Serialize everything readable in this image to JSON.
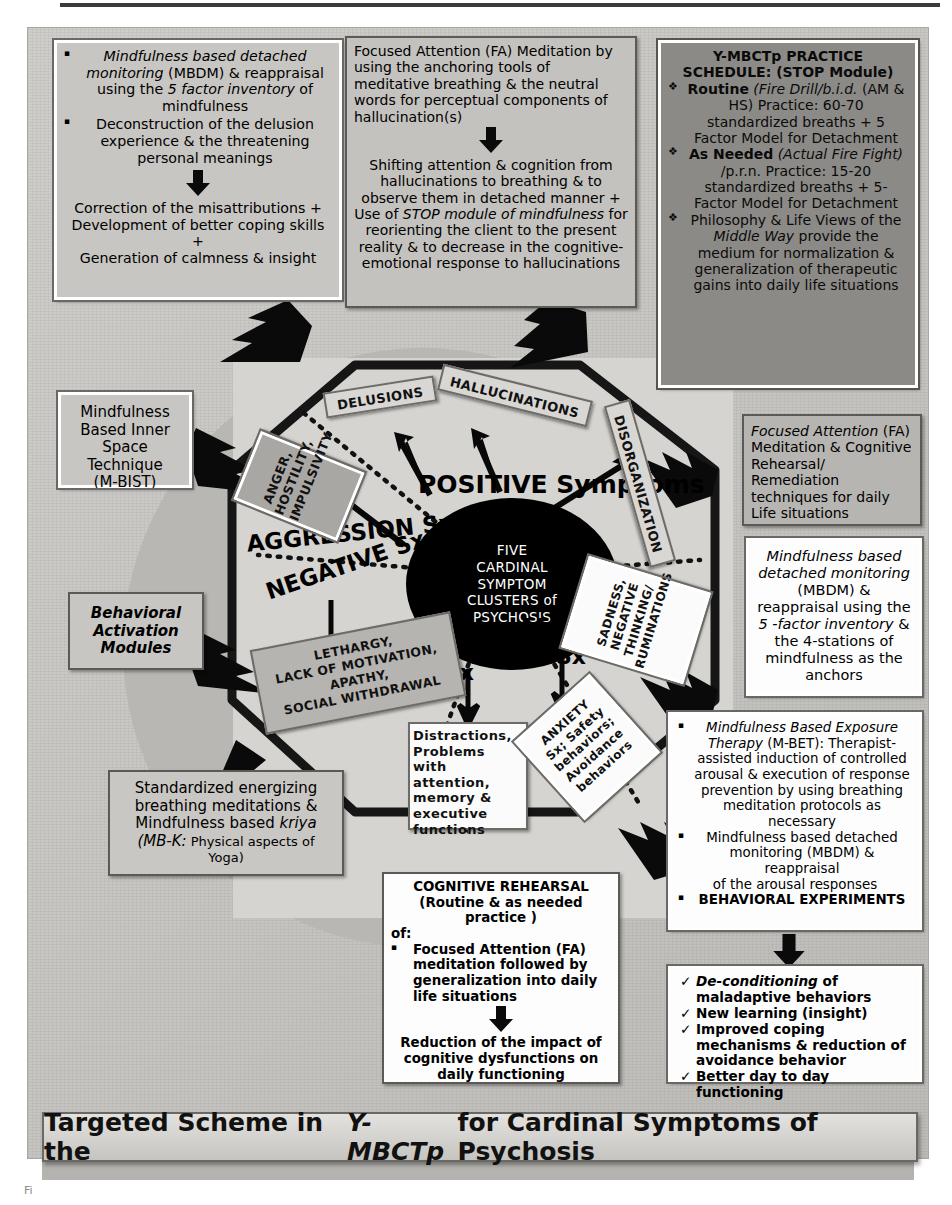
{
  "figure": {
    "banner_title_pre": "Targeted Scheme in the ",
    "banner_title_em": "Y-MBCTp",
    "banner_title_post": " for Cardinal Symptoms of Psychosis",
    "caption": "Fi"
  },
  "core": {
    "lines": [
      "FIVE",
      "CARDINAL",
      "SYMPTOM",
      "CLUSTERS of",
      "PSYCHOSIS"
    ]
  },
  "clusters": {
    "positive": "POSITIVE Symptoms",
    "aggression": "AGGRESSION Sx",
    "negative": "NEGATIVE Sx",
    "cognitive_l1": "COGNITIVE",
    "cognitive_l2": "Sx",
    "affective_l1": "AFFECTIVE",
    "affective_l2": "Sx"
  },
  "symptom_nodes": {
    "delusions": "DELUSIONS",
    "hallucinations": "HALLUCINATIONS",
    "disorganization": "DISORGANIZATION",
    "anger": "ANGER,\nHOSTILITY,\nIMPULSIVITY",
    "anger_lines": [
      "ANGER,",
      "HOSTILITY,",
      "IMPULSIVITY"
    ],
    "lethargy_lines": [
      "LETHARGY,",
      "LACK OF MOTIVATION,",
      "APATHY,",
      "SOCIAL WITHDRAWAL"
    ],
    "distractions_lines": [
      "Distractions,",
      "Problems with",
      "attention,",
      "memory  &",
      "executive",
      "functions"
    ],
    "sadness_lines": [
      "SADNESS,",
      "NEGATIVE",
      "THINKING/",
      "RUMINATIONS"
    ],
    "anxiety_lines": [
      "ANXIETY",
      "Sx; Safety",
      "behaviors;",
      "Avoidance",
      "behaviors"
    ]
  },
  "boxes": {
    "delusion_intervention": {
      "bullet1_em": "Mindfulness based detached monitoring",
      "bullet1_rest_a": " (MBDM) & reappraisal using the ",
      "bullet1_em2": "5 factor inventory",
      "bullet1_rest_b": " of mindfulness",
      "bullet2": "Deconstruction of the delusion experience & the threatening personal meanings",
      "outcome_l1": "Correction of the misattributions +",
      "outcome_l2": "Development of better coping  skills",
      "outcome_l3": "+",
      "outcome_l4": "Generation of calmness & insight"
    },
    "hallucination_intervention": {
      "top": "Focused Attention (FA) Meditation by using the anchoring tools of meditative breathing & the neutral words for perceptual components of hallucination(s)",
      "bottom_a": "Shifting attention & cognition from hallucinations  to breathing & to observe them in detached manner + Use of ",
      "bottom_em": "STOP module of mindfulness",
      "bottom_b": " for reorienting the client to the present reality & to decrease in the cognitive-emotional response to hallucinations"
    },
    "practice_schedule": {
      "title_l1": "Y-MBCTp  PRACTICE",
      "title_l2": "SCHEDULE: (STOP Module)",
      "item1_b": "Routine",
      "item1_em": " (Fire Drill/b.i.d.",
      "item1_rest": " (AM & HS)  Practice: 60-70 standardized breaths + 5 Factor Model for Detachment",
      "item2_b": "As Needed",
      "item2_em": " (Actual Fire Fight)",
      "item2_rest": " /p.r.n. Practice: 15-20 standardized breaths + 5-Factor Model for Detachment",
      "item3_a": "Philosophy & Life Views of the ",
      "item3_em": "Middle Way",
      "item3_b": " provide the medium for normalization & generalization of therapeutic gains into daily life situations"
    },
    "mbist": {
      "lines": [
        "Mindfulness",
        "Based Inner",
        "Space",
        "Technique",
        "(M-BIST)"
      ]
    },
    "behavioral_activation": {
      "lines": [
        "Behavioral",
        "Activation",
        "Modules"
      ]
    },
    "breathing_kriya": {
      "l1": "Standardized energizing",
      "l2": "breathing meditations &",
      "l3_a": "Mindfulness based ",
      "l3_em": "kriya",
      "l4_em": "(MB-K:",
      "l4_rest": " Physical aspects of",
      "l5": "Yoga)"
    },
    "fa_cognitive_remediation": {
      "em": "Focused Attention",
      "rest": " (FA) Meditation & Cognitive Rehearsal/ Remediation techniques for daily Life situations"
    },
    "mbdm_affective": {
      "em1": "Mindfulness based detached monitoring",
      "rest1": " (MBDM) & reappraisal using the ",
      "em2": "5 -factor inventory",
      "rest2": " & the 4-stations of mindfulness as the anchors"
    },
    "mbet": {
      "b1_em": "Mindfulness Based Exposure Therapy",
      "b1_rest": " (M-BET): Therapist-assisted  induction  of controlled arousal & execution of response prevention by using breathing meditation protocols as necessary",
      "b2": "Mindfulness based detached monitoring (MBDM) & reappraisal",
      "b2_tail": "of the arousal  responses",
      "b3": "BEHAVIORAL EXPERIMENTS"
    },
    "outcomes": {
      "c1_em": "De-conditioning",
      "c1_rest": " of maladaptive behaviors",
      "c2": "New learning (insight)",
      "c3": "Improved coping mechanisms & reduction of avoidance behavior",
      "c4": "Better day to day functioning"
    },
    "cognitive_rehearsal": {
      "title": "COGNITIVE REHEARSAL",
      "sub": "(Routine & as needed practice )",
      "of": "of:",
      "bullet": "Focused Attention (FA) meditation followed by generalization into daily life situations",
      "outcome": "Reduction of the impact of cognitive dysfunctions on daily functioning"
    }
  }
}
